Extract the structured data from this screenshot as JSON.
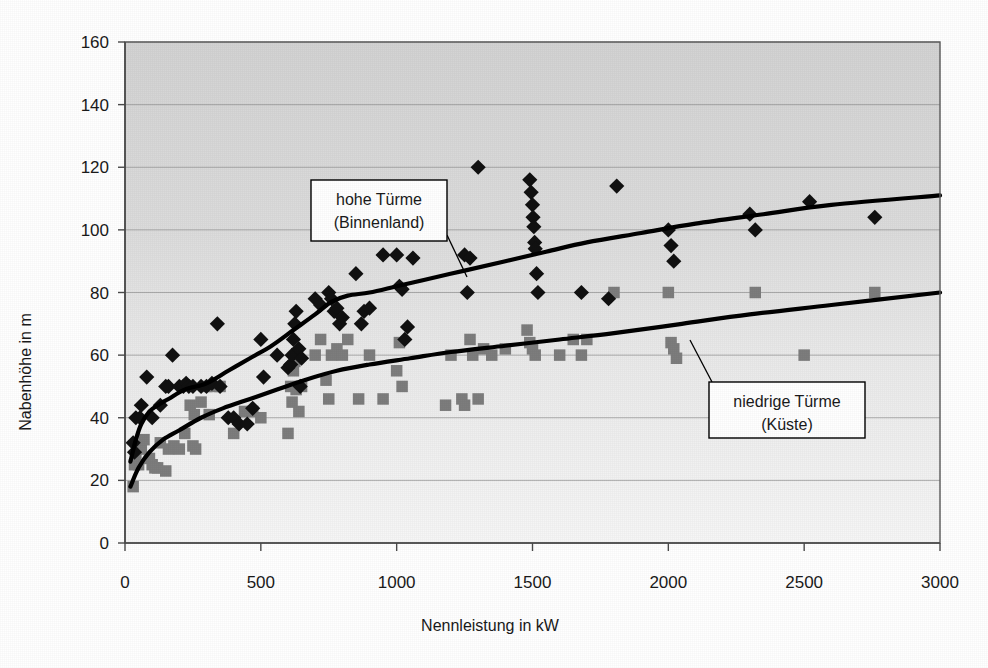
{
  "chart_data": {
    "type": "scatter",
    "title": "",
    "xlabel": "Nennleistung in kW",
    "ylabel": "Nabenhöhe in m",
    "xlim": [
      0,
      3000
    ],
    "ylim": [
      0,
      160
    ],
    "xticks": [
      0,
      500,
      1000,
      1500,
      2000,
      2500,
      3000
    ],
    "yticks": [
      0,
      20,
      40,
      60,
      80,
      100,
      120,
      140,
      160
    ],
    "xtick_labels": [
      "0",
      "500",
      "1000",
      "1500",
      "2000",
      "2500",
      "3000"
    ],
    "ytick_labels": [
      "0",
      "20",
      "40",
      "60",
      "80",
      "100",
      "120",
      "140",
      "160"
    ],
    "grid": "horizontal",
    "legend_position": "none",
    "plot_background": "#d8d8d8",
    "series": [
      {
        "name": "hohe Türme (Binnenland)",
        "marker": "diamond",
        "color": "#111111",
        "points": [
          [
            30,
            32
          ],
          [
            35,
            29
          ],
          [
            40,
            40
          ],
          [
            55,
            40
          ],
          [
            60,
            44
          ],
          [
            80,
            53
          ],
          [
            100,
            40
          ],
          [
            130,
            44
          ],
          [
            150,
            50
          ],
          [
            160,
            50
          ],
          [
            175,
            60
          ],
          [
            200,
            50
          ],
          [
            215,
            50
          ],
          [
            225,
            51
          ],
          [
            235,
            50
          ],
          [
            250,
            50
          ],
          [
            280,
            50
          ],
          [
            300,
            50
          ],
          [
            320,
            51
          ],
          [
            340,
            70
          ],
          [
            350,
            50
          ],
          [
            380,
            40
          ],
          [
            400,
            40
          ],
          [
            420,
            38
          ],
          [
            450,
            38
          ],
          [
            470,
            43
          ],
          [
            500,
            65
          ],
          [
            510,
            53
          ],
          [
            560,
            60
          ],
          [
            600,
            56
          ],
          [
            610,
            57
          ],
          [
            615,
            60
          ],
          [
            620,
            65
          ],
          [
            625,
            70
          ],
          [
            630,
            74
          ],
          [
            640,
            62
          ],
          [
            645,
            50
          ],
          [
            650,
            59
          ],
          [
            700,
            78
          ],
          [
            720,
            76
          ],
          [
            750,
            80
          ],
          [
            760,
            78
          ],
          [
            770,
            74
          ],
          [
            780,
            75
          ],
          [
            790,
            70
          ],
          [
            800,
            72
          ],
          [
            850,
            86
          ],
          [
            870,
            70
          ],
          [
            880,
            74
          ],
          [
            900,
            75
          ],
          [
            950,
            92
          ],
          [
            1000,
            92
          ],
          [
            1010,
            82
          ],
          [
            1020,
            81
          ],
          [
            1030,
            65
          ],
          [
            1040,
            69
          ],
          [
            1060,
            91
          ],
          [
            1250,
            92
          ],
          [
            1260,
            80
          ],
          [
            1270,
            91
          ],
          [
            1300,
            120
          ],
          [
            1490,
            116
          ],
          [
            1495,
            112
          ],
          [
            1500,
            108
          ],
          [
            1502,
            104
          ],
          [
            1505,
            101
          ],
          [
            1508,
            96
          ],
          [
            1510,
            94
          ],
          [
            1515,
            86
          ],
          [
            1520,
            80
          ],
          [
            1680,
            80
          ],
          [
            1780,
            78
          ],
          [
            1810,
            114
          ],
          [
            2000,
            100
          ],
          [
            2010,
            95
          ],
          [
            2020,
            90
          ],
          [
            2300,
            105
          ],
          [
            2320,
            100
          ],
          [
            2520,
            109
          ],
          [
            2760,
            104
          ]
        ]
      },
      {
        "name": "niedrige Türme (Küste)",
        "marker": "square",
        "color": "#7d7d7d",
        "points": [
          [
            30,
            18
          ],
          [
            35,
            25
          ],
          [
            40,
            27
          ],
          [
            50,
            25
          ],
          [
            60,
            30
          ],
          [
            70,
            33
          ],
          [
            90,
            27
          ],
          [
            100,
            25
          ],
          [
            110,
            24
          ],
          [
            120,
            24
          ],
          [
            130,
            32
          ],
          [
            150,
            23
          ],
          [
            160,
            30
          ],
          [
            180,
            31
          ],
          [
            200,
            30
          ],
          [
            220,
            35
          ],
          [
            240,
            44
          ],
          [
            250,
            31
          ],
          [
            255,
            41
          ],
          [
            260,
            30
          ],
          [
            280,
            45
          ],
          [
            300,
            50
          ],
          [
            310,
            41
          ],
          [
            330,
            50
          ],
          [
            350,
            50
          ],
          [
            400,
            35
          ],
          [
            440,
            42
          ],
          [
            470,
            42
          ],
          [
            500,
            40
          ],
          [
            600,
            35
          ],
          [
            610,
            50
          ],
          [
            615,
            45
          ],
          [
            620,
            55
          ],
          [
            625,
            58
          ],
          [
            630,
            49
          ],
          [
            640,
            42
          ],
          [
            650,
            50
          ],
          [
            700,
            60
          ],
          [
            720,
            65
          ],
          [
            740,
            52
          ],
          [
            750,
            46
          ],
          [
            760,
            60
          ],
          [
            780,
            62
          ],
          [
            800,
            60
          ],
          [
            820,
            65
          ],
          [
            860,
            46
          ],
          [
            900,
            60
          ],
          [
            950,
            46
          ],
          [
            1000,
            55
          ],
          [
            1010,
            64
          ],
          [
            1020,
            50
          ],
          [
            1180,
            44
          ],
          [
            1200,
            60
          ],
          [
            1240,
            46
          ],
          [
            1250,
            44
          ],
          [
            1300,
            46
          ],
          [
            1270,
            65
          ],
          [
            1280,
            60
          ],
          [
            1320,
            62
          ],
          [
            1350,
            60
          ],
          [
            1400,
            62
          ],
          [
            1480,
            68
          ],
          [
            1490,
            64
          ],
          [
            1500,
            62
          ],
          [
            1510,
            60
          ],
          [
            1600,
            60
          ],
          [
            1650,
            65
          ],
          [
            1680,
            60
          ],
          [
            1700,
            65
          ],
          [
            1800,
            80
          ],
          [
            2000,
            80
          ],
          [
            2010,
            64
          ],
          [
            2020,
            62
          ],
          [
            2030,
            59
          ],
          [
            2320,
            80
          ],
          [
            2500,
            60
          ],
          [
            2760,
            80
          ]
        ]
      }
    ],
    "trend_lines": [
      {
        "name": "hohe Türme (Binnenland)",
        "points": [
          [
            20,
            26
          ],
          [
            40,
            33
          ],
          [
            60,
            38
          ],
          [
            90,
            42
          ],
          [
            120,
            44
          ],
          [
            160,
            46
          ],
          [
            220,
            49
          ],
          [
            300,
            51
          ],
          [
            380,
            55
          ],
          [
            460,
            59
          ],
          [
            540,
            63
          ],
          [
            620,
            68
          ],
          [
            700,
            73
          ],
          [
            760,
            77
          ],
          [
            820,
            79
          ],
          [
            900,
            80
          ],
          [
            1000,
            82
          ],
          [
            1100,
            84
          ],
          [
            1250,
            87
          ],
          [
            1400,
            90
          ],
          [
            1550,
            93
          ],
          [
            1700,
            96
          ],
          [
            1900,
            99
          ],
          [
            2100,
            102
          ],
          [
            2350,
            105
          ],
          [
            2600,
            108
          ],
          [
            3000,
            111
          ]
        ]
      },
      {
        "name": "niedrige Türme (Küste)",
        "points": [
          [
            20,
            18
          ],
          [
            50,
            24
          ],
          [
            90,
            29
          ],
          [
            140,
            33
          ],
          [
            200,
            36
          ],
          [
            280,
            40
          ],
          [
            360,
            43
          ],
          [
            460,
            46
          ],
          [
            560,
            49
          ],
          [
            660,
            52
          ],
          [
            780,
            55
          ],
          [
            900,
            57
          ],
          [
            1050,
            59
          ],
          [
            1200,
            61
          ],
          [
            1400,
            63
          ],
          [
            1600,
            65
          ],
          [
            1800,
            67
          ],
          [
            2050,
            70
          ],
          [
            2300,
            73
          ],
          [
            2600,
            76
          ],
          [
            3000,
            80
          ]
        ]
      }
    ],
    "annotations": [
      {
        "id": "high-towers-callout",
        "lines": [
          "hohe Türme",
          "(Binnenland)"
        ],
        "box": {
          "x": 311,
          "y": 180,
          "w": 136,
          "h": 61
        },
        "leader": [
          [
            447,
            235
          ],
          [
            467,
            277
          ]
        ]
      },
      {
        "id": "low-towers-callout",
        "lines": [
          "niedrige Türme",
          "(Küste)"
        ],
        "box": {
          "x": 709,
          "y": 382,
          "w": 156,
          "h": 56
        },
        "leader": [
          [
            712,
            382
          ],
          [
            690,
            340
          ]
        ]
      }
    ]
  },
  "colors": {
    "plot_bg_top": "#d5d5d5",
    "plot_bg_bottom": "#f2f2f2",
    "grid": "#8a8a8a",
    "axis": "#4a4a4a",
    "diamond": "#111111",
    "square": "#7d7d7d",
    "trend": "#000000",
    "callout_bg": "#ffffff",
    "callout_border": "#000000"
  }
}
